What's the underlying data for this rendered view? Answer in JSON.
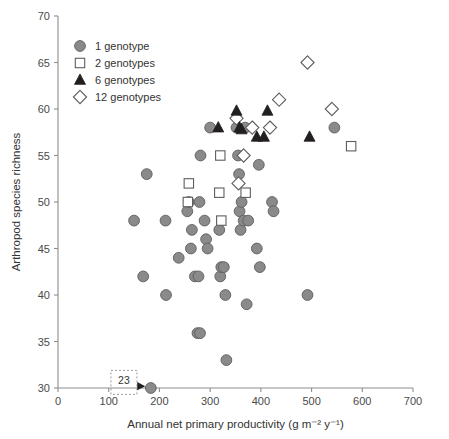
{
  "chart_data": {
    "type": "scatter",
    "title": "",
    "xlabel": "Annual net primary productivity (g m⁻² y⁻¹)",
    "ylabel": "Arthropod species richness",
    "xlim": [
      0,
      700
    ],
    "ylim": [
      30,
      70
    ],
    "xticks": [
      0,
      100,
      200,
      300,
      400,
      500,
      600,
      700
    ],
    "yticks": [
      30,
      35,
      40,
      45,
      50,
      55,
      60,
      65,
      70
    ],
    "xtick_labels": [
      "0",
      "100",
      "200",
      "300",
      "400",
      "500",
      "600",
      "700"
    ],
    "ytick_labels": [
      "30",
      "35",
      "40",
      "45",
      "50",
      "55",
      "60",
      "65",
      "70"
    ],
    "grid": false,
    "legend_position": "top-left",
    "annotations": [
      {
        "name": "n-label",
        "text": "23",
        "x": 130,
        "y": 30.6,
        "arrow_to_x": 176,
        "arrow_to_y": 30.2,
        "boxed": true
      }
    ],
    "series": [
      {
        "name": "1 genotype",
        "marker": "circle",
        "fill": "#8a8a8a",
        "edge": "#5e5e5e",
        "points": [
          [
            150,
            48
          ],
          [
            175,
            53
          ],
          [
            183,
            30
          ],
          [
            212,
            48
          ],
          [
            213,
            40
          ],
          [
            168,
            42
          ],
          [
            238,
            44
          ],
          [
            255,
            49
          ],
          [
            258,
            50
          ],
          [
            262,
            45
          ],
          [
            264,
            47
          ],
          [
            270,
            42
          ],
          [
            275,
            35.9
          ],
          [
            280,
            35.9
          ],
          [
            277,
            42
          ],
          [
            279,
            50
          ],
          [
            281,
            55
          ],
          [
            289,
            48
          ],
          [
            292,
            46
          ],
          [
            295,
            45
          ],
          [
            300,
            58
          ],
          [
            318,
            47
          ],
          [
            320,
            42
          ],
          [
            322,
            43
          ],
          [
            327,
            43
          ],
          [
            330,
            40
          ],
          [
            332,
            33
          ],
          [
            352,
            58
          ],
          [
            355,
            55
          ],
          [
            357,
            53
          ],
          [
            358,
            49
          ],
          [
            360,
            47
          ],
          [
            362,
            50
          ],
          [
            366,
            48
          ],
          [
            369,
            58
          ],
          [
            372,
            39
          ],
          [
            375,
            48
          ],
          [
            392,
            45
          ],
          [
            396,
            54
          ],
          [
            398,
            43
          ],
          [
            422,
            50
          ],
          [
            425,
            49
          ],
          [
            492,
            40
          ],
          [
            545,
            58
          ]
        ]
      },
      {
        "name": "2 genotypes",
        "marker": "square",
        "fill": "#ffffff",
        "edge": "#5e5e5e",
        "points": [
          [
            258,
            52
          ],
          [
            256,
            50
          ],
          [
            320,
            55
          ],
          [
            318,
            51
          ],
          [
            322,
            48
          ],
          [
            370,
            51
          ],
          [
            578,
            56
          ]
        ]
      },
      {
        "name": "6 genotypes",
        "marker": "triangle",
        "fill": "#231f20",
        "edge": "#231f20",
        "points": [
          [
            316,
            58
          ],
          [
            352,
            59.8
          ],
          [
            358,
            58
          ],
          [
            362,
            57.8
          ],
          [
            392,
            57
          ],
          [
            406,
            57
          ],
          [
            413,
            59.8
          ],
          [
            496,
            57
          ]
        ]
      },
      {
        "name": "12 genotypes",
        "marker": "diamond",
        "fill": "#ffffff",
        "edge": "#5e5e5e",
        "points": [
          [
            352,
            59
          ],
          [
            356,
            52
          ],
          [
            366,
            55
          ],
          [
            383,
            58
          ],
          [
            418,
            58
          ],
          [
            436,
            61
          ],
          [
            492,
            65
          ],
          [
            540,
            60
          ]
        ]
      }
    ]
  },
  "legend": {
    "items": [
      {
        "label": "1 genotype",
        "marker": "circle"
      },
      {
        "label": "2 genotypes",
        "marker": "square"
      },
      {
        "label": "6 genotypes",
        "marker": "triangle"
      },
      {
        "label": "12 genotypes",
        "marker": "diamond"
      }
    ]
  }
}
